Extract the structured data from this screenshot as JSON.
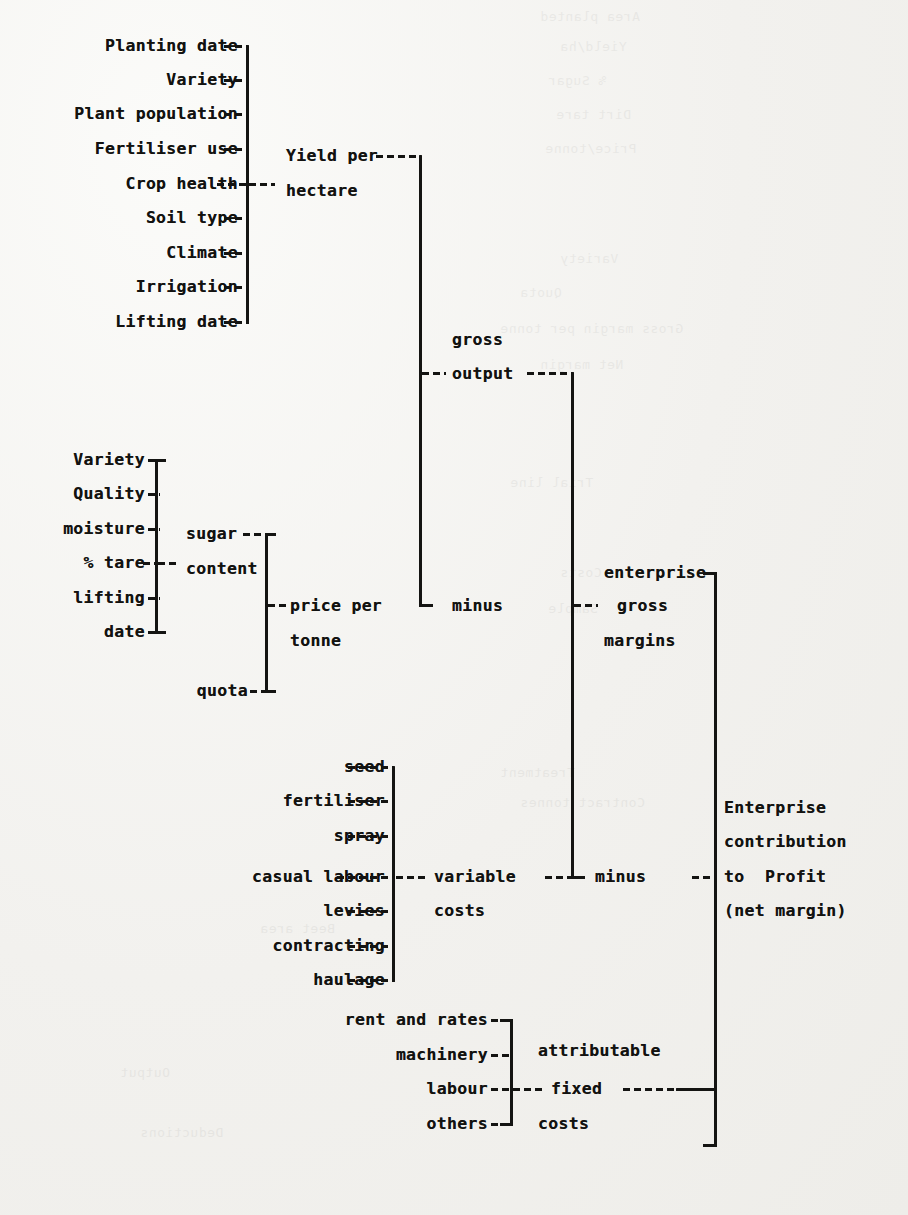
{
  "document": {
    "type": "hierarchy-diagram",
    "title": "Sugar beet enterprise gross margin / net margin build-up",
    "medium": "scanned typewritten page, bold monospace type, dashed leader lines and square brackets"
  },
  "groups": {
    "yield_factors": {
      "label": "factors determining yield per hectare",
      "items": [
        "Planting date",
        "Variety",
        "Plant population",
        "Fertiliser use",
        "Crop health",
        "Soil type",
        "Climate",
        "Irrigation",
        "Lifting date"
      ],
      "result": [
        "Yield per",
        "hectare"
      ]
    },
    "quality_factors": {
      "label": "factors determining sugar content",
      "items": [
        "Variety",
        "Quality",
        "moisture",
        "% tare",
        "lifting",
        "date"
      ],
      "result": [
        "sugar",
        "content"
      ]
    },
    "price_inputs": {
      "extra_item": "quota",
      "result": [
        "price per",
        "tonne"
      ]
    },
    "variable_costs": {
      "label": "variable cost items",
      "items": [
        "seed",
        "fertiliser",
        "spray",
        "casual labour",
        "levies",
        "contracting",
        "haulage"
      ],
      "result": [
        "variable",
        "costs"
      ]
    },
    "fixed_costs": {
      "label": "attributable fixed cost items",
      "items": [
        "rent and rates",
        "machinery",
        "labour",
        "others"
      ],
      "result": [
        "attributable",
        "fixed",
        "costs"
      ]
    }
  },
  "results": {
    "gross_output": [
      "gross",
      "output"
    ],
    "enterprise_gross_margins": [
      "enterprise",
      "gross",
      "margins"
    ],
    "net_margin": [
      "Enterprise",
      "contribution",
      "to  Profit",
      "(net margin)"
    ]
  },
  "operators": {
    "minus_upper": "minus",
    "minus_lower": "minus"
  },
  "colors": {
    "ink": "#121210",
    "paper": "#f3f2ef",
    "rule": "#141412"
  },
  "ghost_text": {
    "note": "faint mirrored bleed-through from the reverse of the page",
    "lines": [
      "Area planted",
      "Yield/ha",
      "% Sugar",
      "Dirt tare",
      "Price/tonne",
      "Variety",
      "Quota",
      "Gross margin per tonne",
      "Net margin",
      "Trial line",
      "Costs",
      "Sample",
      "Treatment",
      "Contract tonnes",
      "Beet area",
      "Output",
      "Deductions"
    ]
  }
}
